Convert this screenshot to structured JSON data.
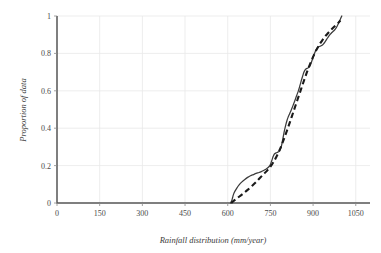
{
  "chart_data": {
    "type": "line",
    "title": "",
    "xlabel": "Rainfall distribution (mm/year)",
    "ylabel": "Proportion of data",
    "xlim": [
      0,
      1100
    ],
    "ylim": [
      0,
      1
    ],
    "xticks": [
      0,
      150,
      300,
      450,
      600,
      750,
      900,
      1050
    ],
    "xtick_labels": [
      "0",
      "150",
      "300",
      "450",
      "600",
      "750",
      "900",
      "1050"
    ],
    "yticks": [
      0,
      0.2,
      0.4,
      0.6,
      0.8,
      1
    ],
    "ytick_labels": [
      "0",
      "0.2",
      "0.4",
      "0.6",
      "0.8",
      "1"
    ],
    "grid": true,
    "legend": "none",
    "series": [
      {
        "name": "empirical-cdf",
        "style": "solid",
        "color": "#3b3b3b",
        "points": [
          [
            610,
            0.0
          ],
          [
            614,
            0.012
          ],
          [
            617,
            0.028
          ],
          [
            620,
            0.045
          ],
          [
            625,
            0.062
          ],
          [
            632,
            0.08
          ],
          [
            640,
            0.097
          ],
          [
            650,
            0.113
          ],
          [
            660,
            0.126
          ],
          [
            670,
            0.137
          ],
          [
            680,
            0.146
          ],
          [
            690,
            0.152
          ],
          [
            700,
            0.158
          ],
          [
            710,
            0.163
          ],
          [
            718,
            0.168
          ],
          [
            726,
            0.174
          ],
          [
            734,
            0.181
          ],
          [
            742,
            0.19
          ],
          [
            748,
            0.2
          ],
          [
            752,
            0.214
          ],
          [
            756,
            0.232
          ],
          [
            760,
            0.25
          ],
          [
            764,
            0.262
          ],
          [
            770,
            0.268
          ],
          [
            776,
            0.272
          ],
          [
            782,
            0.278
          ],
          [
            788,
            0.3
          ],
          [
            792,
            0.33
          ],
          [
            796,
            0.362
          ],
          [
            800,
            0.392
          ],
          [
            804,
            0.418
          ],
          [
            808,
            0.44
          ],
          [
            812,
            0.458
          ],
          [
            816,
            0.472
          ],
          [
            820,
            0.486
          ],
          [
            826,
            0.508
          ],
          [
            832,
            0.532
          ],
          [
            838,
            0.556
          ],
          [
            843,
            0.578
          ],
          [
            848,
            0.598
          ],
          [
            852,
            0.618
          ],
          [
            856,
            0.64
          ],
          [
            860,
            0.662
          ],
          [
            864,
            0.682
          ],
          [
            868,
            0.7
          ],
          [
            872,
            0.712
          ],
          [
            876,
            0.718
          ],
          [
            882,
            0.722
          ],
          [
            888,
            0.73
          ],
          [
            893,
            0.748
          ],
          [
            898,
            0.77
          ],
          [
            903,
            0.792
          ],
          [
            908,
            0.812
          ],
          [
            913,
            0.826
          ],
          [
            918,
            0.834
          ],
          [
            924,
            0.838
          ],
          [
            930,
            0.842
          ],
          [
            936,
            0.85
          ],
          [
            942,
            0.862
          ],
          [
            948,
            0.876
          ],
          [
            954,
            0.89
          ],
          [
            960,
            0.902
          ],
          [
            966,
            0.912
          ],
          [
            972,
            0.92
          ],
          [
            978,
            0.93
          ],
          [
            984,
            0.944
          ],
          [
            990,
            0.962
          ],
          [
            995,
            0.98
          ],
          [
            999,
            0.994
          ],
          [
            1001,
            1.0
          ]
        ]
      },
      {
        "name": "fitted-distribution",
        "style": "dashed",
        "color": "#1a1a1a",
        "points": [
          [
            612,
            0.0
          ],
          [
            620,
            0.01
          ],
          [
            630,
            0.022
          ],
          [
            642,
            0.036
          ],
          [
            656,
            0.052
          ],
          [
            670,
            0.07
          ],
          [
            684,
            0.09
          ],
          [
            698,
            0.11
          ],
          [
            712,
            0.132
          ],
          [
            726,
            0.154
          ],
          [
            740,
            0.176
          ],
          [
            752,
            0.198
          ],
          [
            762,
            0.222
          ],
          [
            772,
            0.25
          ],
          [
            782,
            0.282
          ],
          [
            790,
            0.312
          ],
          [
            798,
            0.344
          ],
          [
            806,
            0.378
          ],
          [
            814,
            0.412
          ],
          [
            822,
            0.448
          ],
          [
            830,
            0.484
          ],
          [
            838,
            0.52
          ],
          [
            846,
            0.556
          ],
          [
            854,
            0.592
          ],
          [
            862,
            0.628
          ],
          [
            870,
            0.664
          ],
          [
            878,
            0.698
          ],
          [
            886,
            0.73
          ],
          [
            894,
            0.76
          ],
          [
            902,
            0.788
          ],
          [
            910,
            0.814
          ],
          [
            918,
            0.836
          ],
          [
            926,
            0.856
          ],
          [
            934,
            0.874
          ],
          [
            942,
            0.89
          ],
          [
            950,
            0.904
          ],
          [
            958,
            0.918
          ],
          [
            966,
            0.93
          ],
          [
            974,
            0.942
          ],
          [
            982,
            0.954
          ],
          [
            990,
            0.966
          ],
          [
            996,
            0.976
          ]
        ]
      }
    ]
  },
  "layout": {
    "plot_left": 57,
    "plot_right": 370,
    "plot_top": 16,
    "plot_bottom": 203
  }
}
